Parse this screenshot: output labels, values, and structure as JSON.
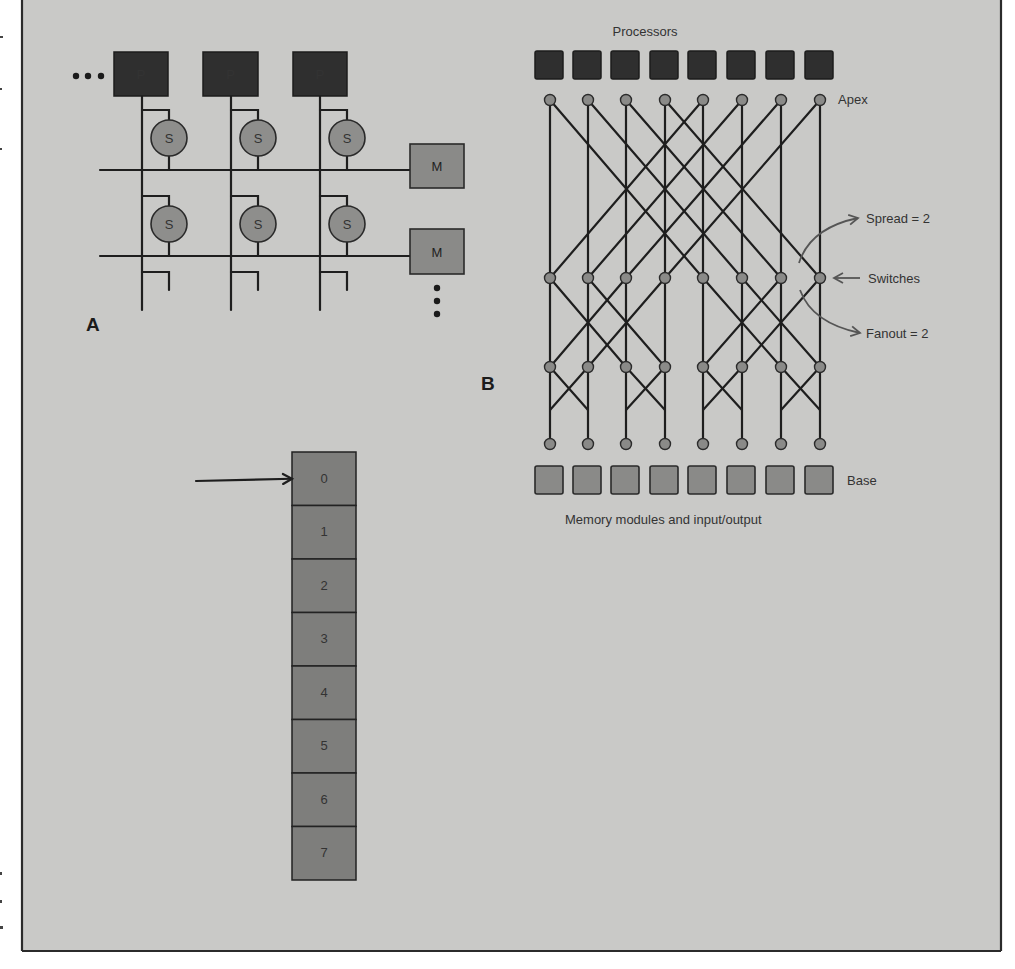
{
  "figure": {
    "background": "#c9c9c7",
    "frame": {
      "left": 22,
      "top": 0,
      "right": 1001,
      "bottom": 951
    }
  },
  "panelA": {
    "letter": "A",
    "ellipsis_left": "•••",
    "processor_label": "P",
    "switch_label": "S",
    "memory_label": "M",
    "processors": [
      {
        "x": 114,
        "y": 52,
        "w": 54,
        "h": 44,
        "bus_x": 142
      },
      {
        "x": 203,
        "y": 52,
        "w": 55,
        "h": 44,
        "bus_x": 231
      },
      {
        "x": 293,
        "y": 52,
        "w": 54,
        "h": 44,
        "bus_x": 320
      }
    ],
    "rows": [
      {
        "bus_y": 170,
        "switch_cy": 138,
        "memory": {
          "x": 410,
          "y": 144,
          "w": 54,
          "h": 44
        }
      },
      {
        "bus_y": 256,
        "switch_cy": 224,
        "memory": {
          "x": 410,
          "y": 229,
          "w": 54,
          "h": 45
        }
      }
    ],
    "switch_offsets_x": 27,
    "switch_r": 18,
    "bus_x_start": 100,
    "bus_y_end": 310
  },
  "panelB": {
    "letter": "B",
    "title": "Processors",
    "apex_label": "Apex",
    "switches_label": "Switches",
    "spread_label": "Spread = 2",
    "fanout_label": "Fanout = 2",
    "base_label": "Base",
    "caption": "Memory modules and input/output",
    "columns_x": [
      550,
      588,
      626,
      665,
      703,
      742,
      781,
      820
    ],
    "rows_y": {
      "apex": 100,
      "mid1": 278,
      "mid2": 367,
      "bottom": 444
    },
    "processor_row": {
      "y": 51,
      "size": 28
    },
    "base_row": {
      "y": 466,
      "size": 28
    },
    "stages": [
      {
        "name": "stage-1",
        "from": "apex",
        "to": "mid1",
        "stride": 4
      },
      {
        "name": "stage-2",
        "from": "mid1",
        "to": "mid2",
        "stride": 2
      },
      {
        "name": "stage-3",
        "from": "mid2",
        "to": "bottom",
        "stride": 1
      }
    ]
  },
  "panelC": {
    "letter": "C",
    "cut_label": [
      "Cut",
      "deck",
      "here"
    ],
    "circles": [
      "0",
      "1",
      "2",
      "3",
      "4",
      "5",
      "6",
      "7"
    ],
    "cards": [
      "0",
      "1",
      "2",
      "3",
      "4",
      "5",
      "6",
      "7"
    ],
    "circle_cx": 173,
    "circle_r": 25,
    "circle_cy": [
      481,
      534,
      588,
      641,
      694,
      747,
      801,
      854
    ],
    "card_stack": {
      "x": 292,
      "y": 452,
      "w": 64,
      "cell_h": 53.5
    },
    "shuffle_map": [
      0,
      2,
      4,
      6,
      1,
      3,
      5,
      7
    ]
  },
  "panelD": {
    "letter": "D",
    "inputs": [
      "0",
      "1",
      "2",
      "3",
      "4",
      "5",
      "6",
      "7"
    ],
    "outputs": [
      "0",
      "1",
      "2",
      "3",
      "4",
      "5",
      "6",
      "7"
    ],
    "rows_y": [
      622,
      658,
      695,
      731,
      768,
      804,
      840,
      877
    ],
    "box_tops": [
      609,
      682,
      755,
      828
    ],
    "box_h": 62,
    "stages_x": [
      {
        "x": 618,
        "w": 28
      },
      {
        "x": 712,
        "w": 27
      },
      {
        "x": 811,
        "w": 26
      }
    ],
    "input_label_x": 540,
    "output_label_x": 870,
    "shuffle_map": [
      0,
      2,
      4,
      6,
      1,
      3,
      5,
      7
    ]
  }
}
